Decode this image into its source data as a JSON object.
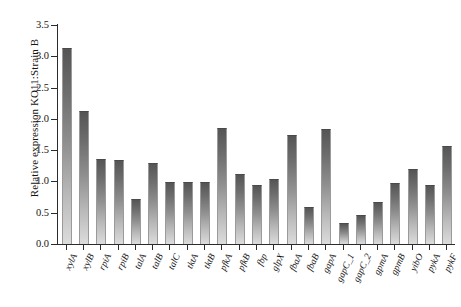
{
  "chart_data": {
    "type": "bar",
    "title": "",
    "subtitle": "",
    "xlabel": "",
    "ylabel": "Relative expression KO11:Strain B",
    "ylim": [
      0.0,
      3.5
    ],
    "ytick_values": [
      0.0,
      0.5,
      1.0,
      1.5,
      2.0,
      2.5,
      3.0,
      3.5
    ],
    "ytick_labels": [
      "0.0",
      "0.5",
      "1.0",
      "1.5",
      "2.0",
      "2.5",
      "3.0",
      "3.5"
    ],
    "grid": false,
    "legend": null,
    "legend_position": "none",
    "bar_fill_top_color": "#555555",
    "bar_fill_bottom_color": "#dcdcdc",
    "axis_color": "#2b2b2b",
    "background_color": "#ffffff",
    "categories": [
      "xylA",
      "xylB",
      "rpiA",
      "rpiB",
      "talA",
      "talB",
      "talC",
      "tktA",
      "tktB",
      "pfkA",
      "pfkB",
      "fbp",
      "glpX",
      "fbaA",
      "fbaB",
      "gapA",
      "gapC_1",
      "gapC_2",
      "gpmA",
      "gpmB",
      "yibO",
      "pykA",
      "pykF"
    ],
    "values": [
      3.12,
      2.11,
      1.34,
      1.32,
      0.7,
      1.28,
      0.97,
      0.97,
      0.97,
      1.84,
      1.1,
      0.92,
      1.02,
      1.72,
      0.58,
      1.83,
      0.32,
      0.45,
      0.65,
      0.96,
      1.19,
      0.92,
      1.55
    ]
  },
  "axis": {
    "y_title": "Relative expression KO11:Strain B"
  }
}
